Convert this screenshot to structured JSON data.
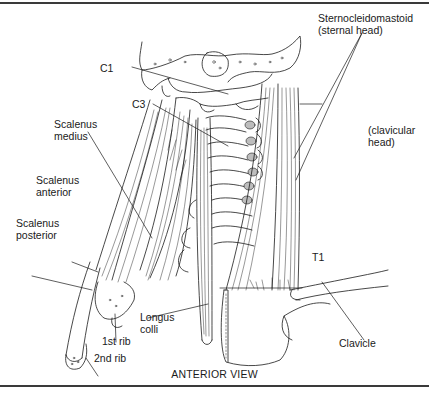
{
  "figure": {
    "caption": "ANTERIOR VIEW",
    "line_color": "#1a1a1a",
    "rule_color": "#3a3a3a",
    "background": "#ffffff"
  },
  "labels": {
    "c1": "C1",
    "c3": "C3",
    "scalenus_medius": [
      "Scalenus",
      "medius"
    ],
    "scalenus_anterior": [
      "Scalenus",
      "anterior"
    ],
    "scalenus_posterior": [
      "Scalenus",
      "posterior"
    ],
    "sternocleidomastoid": [
      "Sternocleidomastoid",
      "(sternal head)"
    ],
    "clavicular_head": [
      "(clavicular",
      "head)"
    ],
    "t1": "T1",
    "longus_colli": [
      "Longus",
      "colli"
    ],
    "first_rib": "1st rib",
    "second_rib": "2nd rib",
    "clavicle": "Clavicle"
  }
}
